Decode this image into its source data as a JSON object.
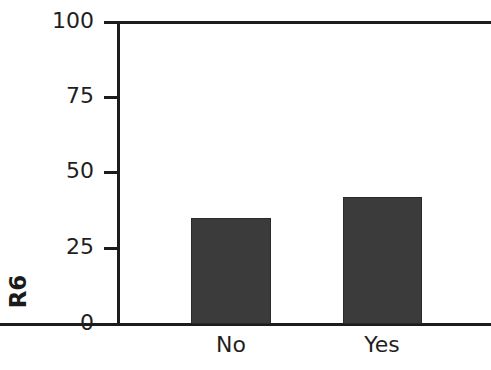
{
  "chart_data": {
    "type": "bar",
    "title": "",
    "subtitle": "",
    "xlabel": "",
    "ylabel": "R6",
    "categories": [
      "No",
      "Yes"
    ],
    "values": [
      35,
      42
    ],
    "series": [
      {
        "name": "R6",
        "values": [
          35,
          42
        ]
      }
    ],
    "ylim": [
      0,
      100
    ],
    "yticks": [
      0,
      25,
      50,
      75,
      100
    ],
    "ytick_labels": [
      "0",
      "25",
      "50",
      "75",
      "100"
    ],
    "grid": false,
    "legend": false,
    "legend_position": "none",
    "bar_color": "#3b3b3b",
    "axis_color": "#1c1c1c",
    "text_color": "#1f1f1f"
  },
  "axis": {
    "y_label_text": "R6",
    "tick_0": "0",
    "tick_25": "25",
    "tick_50": "50",
    "tick_75": "75",
    "tick_100": "100"
  },
  "categories": {
    "cat_0": "No",
    "cat_1": "Yes"
  }
}
